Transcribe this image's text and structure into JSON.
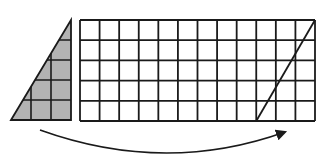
{
  "diagram": {
    "colors": {
      "line": "#1a1a1a",
      "shade": "#b3b3b3",
      "background": "#ffffff"
    },
    "triangle": {
      "columns": 3,
      "rows": 5,
      "cell_size": 20,
      "origin_x": 11,
      "origin_y": 20,
      "shaded": true
    },
    "rectangle_grid": {
      "columns": 12,
      "rows": 5,
      "origin_x": 80,
      "origin_y": 20,
      "width": 235,
      "height": 101,
      "diagonal": {
        "from_col": 9,
        "from_row": 5,
        "to_col": 12,
        "to_row": 0
      }
    },
    "arrow": {
      "start": [
        40,
        130
      ],
      "control": [
        165,
        175
      ],
      "end": [
        285,
        132
      ],
      "direction": "left-to-right"
    }
  }
}
